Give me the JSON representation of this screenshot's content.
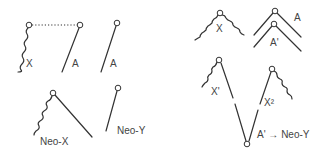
{
  "labels": {
    "x": "X",
    "a": "A",
    "a_alone": "A",
    "neo_x": "Neo-X",
    "neo_y": "Neo-Y",
    "x_right": "X",
    "a_right": "A",
    "a_prime": "A'",
    "x_prime": "X'",
    "x_squared": "X²",
    "result": "A' → Neo-Y"
  },
  "colors": {
    "line": "#333333",
    "text": "#444444",
    "background": "#ffffff"
  }
}
